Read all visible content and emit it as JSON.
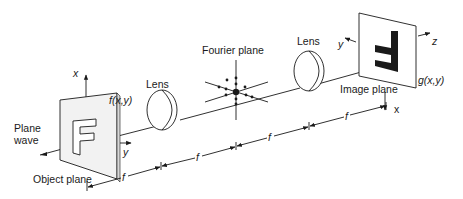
{
  "diagram": {
    "labels": {
      "plane_wave_line1": "Plane",
      "plane_wave_line2": "wave",
      "object_plane": "Object plane",
      "input_function": "f(x,y)",
      "lens1": "Lens",
      "fourier_plane": "Fourier plane",
      "lens2": "Lens",
      "image_plane": "Image plane",
      "output_function": "g(x,y)"
    },
    "axes": {
      "object_x": "x",
      "object_y": "y",
      "image_y": "y",
      "image_z": "z",
      "image_x": "x"
    },
    "distances": [
      "f",
      "f",
      "f",
      "f"
    ],
    "object_letter": "F",
    "image_letter": "F (inverted)",
    "colors": {
      "ink": "#1a1a1a",
      "plane_face": "#f2f2f2",
      "background": "#ffffff"
    }
  }
}
